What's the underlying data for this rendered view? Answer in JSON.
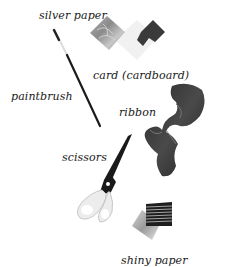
{
  "labels": {
    "silver_paper": "silver paper",
    "card": "card (cardboard)",
    "paintbrush": "paintbrush",
    "ribbon": "ribbon",
    "scissors": "scissors",
    "shiny_paper": "shiny paper"
  },
  "items": [
    {
      "name": "silver paper",
      "icon": "silver-paper-icon"
    },
    {
      "name": "card (cardboard)",
      "icon": "cardboard-icon"
    },
    {
      "name": "paintbrush",
      "icon": "paintbrush-icon"
    },
    {
      "name": "ribbon",
      "icon": "ribbon-icon"
    },
    {
      "name": "scissors",
      "icon": "scissors-icon"
    },
    {
      "name": "shiny paper",
      "icon": "shiny-paper-icon"
    }
  ],
  "colors": {
    "background": "#ffffff",
    "text": "#1a1a1a",
    "ribbon": "#2b2b2b",
    "card_dark": "#3a3a3a",
    "scissors_handle": "#e8e8e8"
  }
}
